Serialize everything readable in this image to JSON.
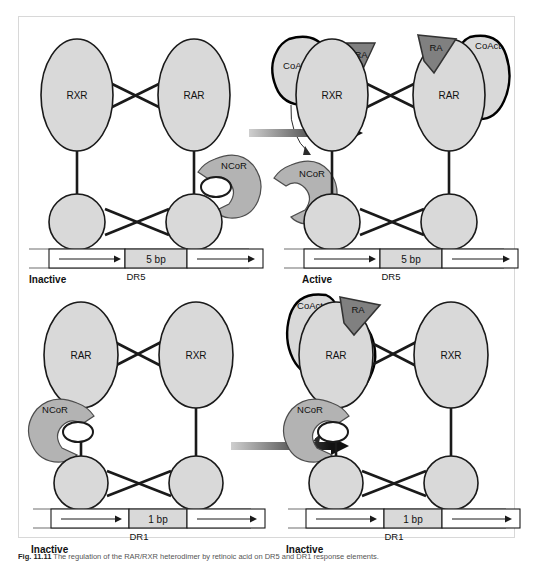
{
  "figure": {
    "caption_prefix": "Fig. 11.11",
    "caption_text": "The regulation of the RAR/RXR heterodimer by retinoic acid on DR5 and DR1 response elements."
  },
  "colors": {
    "receptor_fill": "#d9d9d9",
    "receptor_stroke": "#1a1a1a",
    "ncor_fill": "#b3b3b3",
    "ncor_stroke": "#4d4d4d",
    "coact_fill": "#d9d9d9",
    "coact_stroke": "#000000",
    "ra_fill": "#808080",
    "ra_stroke": "#333333",
    "dna_fill": "#ffffff",
    "spacer_fill": "#d9d9d9",
    "arrow_dark": "#111111",
    "arrow_light": "#cfcfcf",
    "frame_border": "#d8d8d8"
  },
  "panels": [
    {
      "id": "top-left",
      "state_label": "Inactive",
      "element_label": "DR5",
      "spacer_label": "5 bp",
      "receptors": [
        {
          "name": "RXR",
          "side": "left"
        },
        {
          "name": "RAR",
          "side": "right"
        }
      ],
      "corepressor": {
        "name": "NCoR",
        "bound": true,
        "bound_to": "RAR"
      },
      "coactivator": null,
      "ligand": null
    },
    {
      "id": "top-right",
      "state_label": "Active",
      "element_label": "DR5",
      "spacer_label": "5 bp",
      "receptors": [
        {
          "name": "RXR",
          "side": "left"
        },
        {
          "name": "RAR",
          "side": "right"
        }
      ],
      "corepressor": null,
      "coactivator": {
        "name": "CoAct",
        "bound": true,
        "bound_to": "RAR"
      },
      "ligand": {
        "name": "RA",
        "bound": true,
        "bound_to": "RAR"
      }
    },
    {
      "id": "bottom-left",
      "state_label": "Inactive",
      "element_label": "DR1",
      "spacer_label": "1 bp",
      "receptors": [
        {
          "name": "RAR",
          "side": "left"
        },
        {
          "name": "RXR",
          "side": "right"
        }
      ],
      "corepressor": {
        "name": "NCoR",
        "bound": true,
        "bound_to": "RAR"
      },
      "coactivator": null,
      "ligand": null
    },
    {
      "id": "bottom-right",
      "state_label": "Inactive",
      "element_label": "DR1",
      "spacer_label": "1 bp",
      "receptors": [
        {
          "name": "RAR",
          "side": "left"
        },
        {
          "name": "RXR",
          "side": "right"
        }
      ],
      "corepressor": {
        "name": "NCoR",
        "bound": true,
        "bound_to": "RAR"
      },
      "coactivator": {
        "name": "CoAct",
        "bound": true,
        "bound_to": "RAR"
      },
      "ligand": {
        "name": "RA",
        "bound": true,
        "bound_to": "RAR"
      }
    }
  ],
  "transitions": [
    {
      "id": "top-transition",
      "free_coactivator": "CoAct",
      "free_ligand": "RA",
      "released_corepressor": "NCoR",
      "arrow": "gradient-right-arrow"
    },
    {
      "id": "bottom-transition",
      "free_coactivator": "CoAct",
      "free_ligand": "RA",
      "released_corepressor": null,
      "arrow": "gradient-right-arrow"
    }
  ]
}
